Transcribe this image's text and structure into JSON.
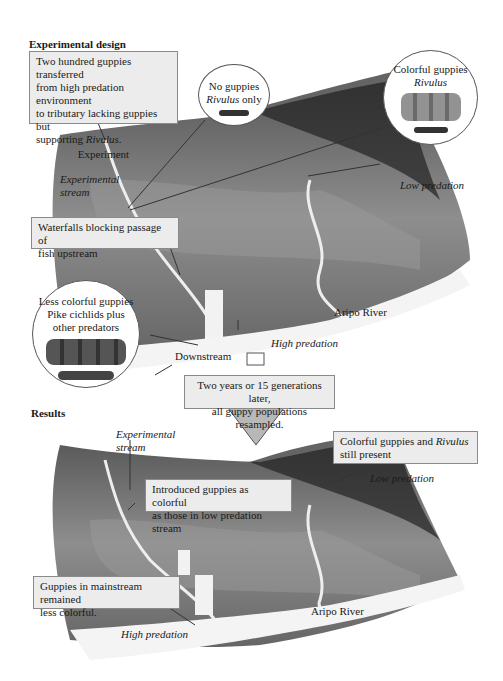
{
  "design": {
    "heading": "Experimental design",
    "transfer_box": {
      "line1": "Two hundred guppies transferred",
      "line2": "from high predation environment",
      "line3": "to tributary lacking guppies but",
      "line4_pre": "supporting ",
      "line4_it": "Rivulus",
      "line4_post": ".",
      "footer": "Experiment"
    },
    "no_guppies_circle": {
      "line1": "No guppies",
      "line2_it": "Rivulus",
      "line2_post": " only"
    },
    "colorful_circle": {
      "line1": "Colorful guppies",
      "line2_it": "Rivulus"
    },
    "experimental_stream": {
      "line1": "Experimental",
      "line2": "stream"
    },
    "waterfall_box": {
      "line1": "Waterfalls blocking passage of",
      "line2": "fish upstream"
    },
    "low_predation": "Low predation",
    "less_colorful_circle": {
      "line1": "Less colorful guppies",
      "line2": "Pike cichlids plus",
      "line3": "other predators"
    },
    "aripo_river": "Aripo River",
    "high_predation": "High predation",
    "downstream": "Downstream"
  },
  "transition": {
    "line1": "Two years or 15 generations later,",
    "line2": "all guppy populations resampled."
  },
  "results": {
    "heading": "Results",
    "experimental_stream": {
      "line1": "Experimental",
      "line2": "stream"
    },
    "colorful_box": {
      "line1_pre": "Colorful guppies and ",
      "line1_it": "Rivulus",
      "line2": "still present"
    },
    "low_predation": "Low predation",
    "introduced_box": {
      "line1": "Introduced guppies as colorful",
      "line2": "as those in low predation stream"
    },
    "mainstream_box": {
      "line1": "Guppies in mainstream remained",
      "line2": "less colorful."
    },
    "aripo_river": "Aripo River",
    "high_predation": "High predation"
  },
  "colors": {
    "box_fill": "#ececec",
    "box_border": "#8a8a8a",
    "arrow_fill": "#b8b8b8",
    "landscape_dark": "#2e2e2e",
    "landscape_mid": "#8a8a8a",
    "water": "#f4f4f4"
  }
}
